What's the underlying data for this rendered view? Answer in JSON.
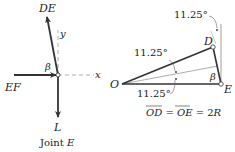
{
  "joint_diagram": {
    "force_de_label": "DE",
    "force_ef_label": "EF",
    "force_l_label": "L",
    "axis_x_label": "x",
    "axis_y_label": "y",
    "angle_label": "β",
    "caption_prefix": "Joint ",
    "caption_var": "E"
  },
  "geometry_diagram": {
    "point_o": "O",
    "point_d": "D",
    "point_e": "E",
    "angle_label": "β",
    "angle_top": "11.25°",
    "angle_upper": "11.25°",
    "angle_lower": "11.25°",
    "equation": {
      "od": "OD",
      "eq1": " = ",
      "oe": "OE",
      "eq2": " = 2",
      "r": "R"
    }
  },
  "colors": {
    "line": "#333333",
    "thin_line": "#888888",
    "text": "#222222"
  }
}
